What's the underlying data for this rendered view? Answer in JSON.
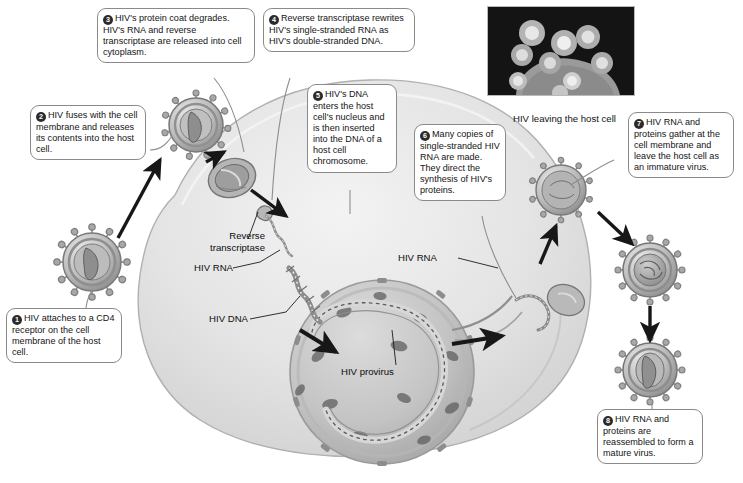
{
  "figure": {
    "micrograph_caption": "HIV leaving the host cell"
  },
  "steps": [
    {
      "number": "1",
      "text": "HIV attaches to a CD4 receptor on the cell membrane of the host cell."
    },
    {
      "number": "2",
      "text": "HIV fuses with the cell membrane and releases its contents into the host cell."
    },
    {
      "number": "3",
      "text": "HIV's protein coat degrades. HIV's RNA and reverse transcriptase are released into cell cytoplasm."
    },
    {
      "number": "4",
      "text": "Reverse transcriptase rewrites HIV's single-stranded RNA as HIV's double-stranded DNA."
    },
    {
      "number": "5",
      "text": "HIV's DNA enters the host cell's nucleus and is then inserted into the DNA of a host cell chromosome."
    },
    {
      "number": "6",
      "text": "Many copies of single-stranded HIV RNA are made. They direct the synthesis of HIV's proteins."
    },
    {
      "number": "7",
      "text": "HIV RNA and proteins gather at the cell membrane and leave the host cell as an immature virus."
    },
    {
      "number": "8",
      "text": "HIV RNA and proteins are reassembled to form a mature virus."
    }
  ],
  "labels": {
    "reverse_transcriptase_line1": "Reverse",
    "reverse_transcriptase_line2": "transcriptase",
    "hiv_rna_left": "HIV RNA",
    "hiv_dna": "HIV DNA",
    "hiv_rna_right": "HIV RNA",
    "hiv_provirus": "HIV provirus"
  },
  "colors": {
    "bubble_border": "#8a8a8a",
    "bubble_fill": "#ffffff",
    "number_badge": "#2b2b2b",
    "text": "#141414",
    "cell_cytoplasm": "#e2e2e2",
    "nucleus": "#c9c9c9",
    "virion_shell": "#9a9a9a",
    "arrow": "#1d1d1d",
    "micrograph_background": "#121212"
  }
}
